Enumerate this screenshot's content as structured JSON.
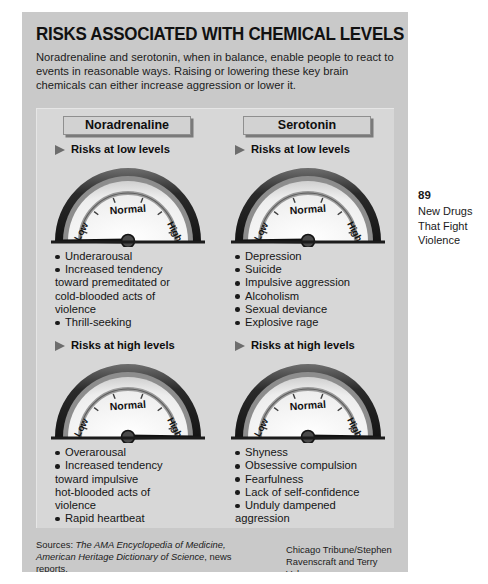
{
  "infographic": {
    "title": "RISKS ASSOCIATED WITH CHEMICAL LEVELS",
    "deck": "Noradrenaline and serotonin, when in balance, enable people to react to events in reasonable ways. Raising or lowering these key brain chemicals can either increase aggression or lower it.",
    "columns": [
      {
        "name": "Noradrenaline",
        "low": {
          "subhead": "Risks at low levels",
          "gauge": {
            "labels": {
              "low": "Low",
              "normal": "Normal",
              "high": "High"
            },
            "needle": "low"
          },
          "items": [
            {
              "text": "Underarousal",
              "bullet": true
            },
            {
              "text": "Increased tendency",
              "bullet": true
            },
            {
              "text": "toward premeditated or",
              "bullet": false
            },
            {
              "text": "cold-blooded acts of",
              "bullet": false
            },
            {
              "text": "violence",
              "bullet": false
            },
            {
              "text": "Thrill-seeking",
              "bullet": true
            }
          ]
        },
        "high": {
          "subhead": "Risks at high levels",
          "gauge": {
            "labels": {
              "low": "Low",
              "normal": "Normal",
              "high": "High"
            },
            "needle": "high"
          },
          "items": [
            {
              "text": "Overarousal",
              "bullet": true
            },
            {
              "text": "Increased tendency",
              "bullet": true
            },
            {
              "text": "toward impulsive",
              "bullet": false
            },
            {
              "text": "hot-blooded acts of",
              "bullet": false
            },
            {
              "text": "violence",
              "bullet": false
            },
            {
              "text": "Rapid heartbeat",
              "bullet": true
            }
          ]
        }
      },
      {
        "name": "Serotonin",
        "low": {
          "subhead": "Risks at low levels",
          "gauge": {
            "labels": {
              "low": "Low",
              "normal": "Normal",
              "high": "High"
            },
            "needle": "low"
          },
          "items": [
            {
              "text": "Depression",
              "bullet": true
            },
            {
              "text": "Suicide",
              "bullet": true
            },
            {
              "text": "Impulsive aggression",
              "bullet": true
            },
            {
              "text": "Alcoholism",
              "bullet": true
            },
            {
              "text": "Sexual deviance",
              "bullet": true
            },
            {
              "text": "Explosive rage",
              "bullet": true
            }
          ]
        },
        "high": {
          "subhead": "Risks at high levels",
          "gauge": {
            "labels": {
              "low": "Low",
              "normal": "Normal",
              "high": "High"
            },
            "needle": "high"
          },
          "items": [
            {
              "text": "Shyness",
              "bullet": true
            },
            {
              "text": "Obsessive compulsion",
              "bullet": true
            },
            {
              "text": "Fearfulness",
              "bullet": true
            },
            {
              "text": "Lack of self-confidence",
              "bullet": true
            },
            {
              "text": "Unduly dampened",
              "bullet": true
            },
            {
              "text": "aggression",
              "bullet": false
            }
          ]
        }
      }
    ],
    "sources": {
      "prefix": "Sources: ",
      "italic1": "The AMA Encyclopedia of Medicine, American Heritage Dictionary of Science",
      "suffix": ", news reports."
    },
    "credit": "Chicago Tribune/Stephen Ravenscraft and Terry Volpp"
  },
  "margin": {
    "page_number": "89",
    "caption_line1": "New Drugs",
    "caption_line2": "That Fight",
    "caption_line3": "Violence"
  },
  "colors": {
    "page_bg": "#ffffff",
    "panel_bg": "#c9c9c9",
    "inner_panel_bg": "#d7d7d7",
    "ink": "#111111",
    "gauge_rim": "#2a2a2a",
    "gauge_face": "#f0f0f0"
  }
}
